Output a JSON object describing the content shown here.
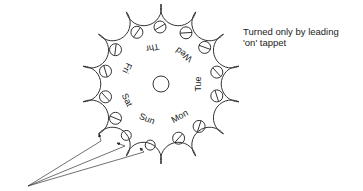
{
  "caption": {
    "line1": "Turned only by leading",
    "line2": "'on' tappet"
  },
  "wheel": {
    "center": [
      161,
      84
    ],
    "outer_radius": 80,
    "teeth": 14,
    "stroke_color": "#333333"
  },
  "days": [
    {
      "label": "Sun",
      "angle": 112,
      "has_screws": false
    },
    {
      "label": "Mon",
      "angle": 60,
      "has_screws": true
    },
    {
      "label": "Tue",
      "angle": 0,
      "has_screws": true
    },
    {
      "label": "Wed",
      "angle": -52,
      "has_screws": true
    },
    {
      "label": "Thr",
      "angle": -103,
      "has_screws": true
    },
    {
      "label": "Fri",
      "angle": -155,
      "has_screws": true
    },
    {
      "label": "Sat",
      "angle": 155,
      "has_screws": true
    }
  ],
  "pointer": {
    "origin": [
      28,
      186
    ],
    "note": "three arrows from a common point to the plain Sun holes"
  }
}
